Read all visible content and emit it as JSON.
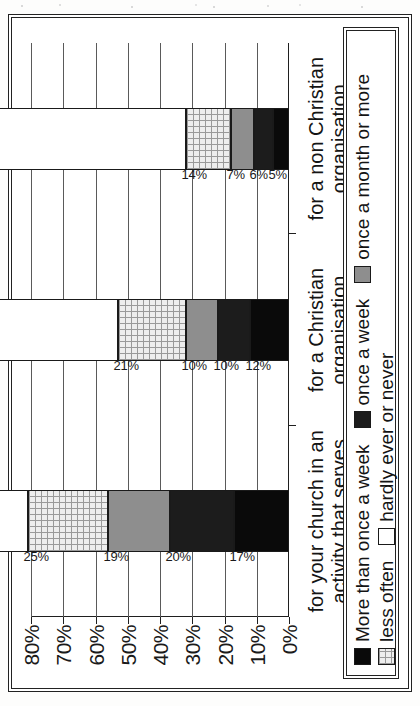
{
  "chart_data": {
    "type": "bar",
    "subtype": "stacked-bar-horizontal-groups",
    "title": "",
    "xlabel": "",
    "ylabel": "",
    "ylim": [
      0,
      80
    ],
    "ytick_labels": [
      "80%",
      "70%",
      "60%",
      "50%",
      "40%",
      "30%",
      "20%",
      "10%",
      "0%"
    ],
    "ytick_values": [
      80,
      70,
      60,
      50,
      40,
      30,
      20,
      10,
      0
    ],
    "grid": true,
    "legend_position": "bottom",
    "orientation_note": "figure printed rotated 90 degrees counter-clockwise on the page",
    "categories": [
      "for your church in an activity that serves the community",
      "for a Christian organisation",
      "for a non Christian organisation"
    ],
    "series": [
      {
        "name": "More than once a week",
        "values": [
          17,
          12,
          5
        ],
        "color": "#0a0a0a",
        "pattern": "solid"
      },
      {
        "name": "once a week",
        "values": [
          20,
          10,
          6
        ],
        "color": "#1c1c1c",
        "pattern": "solid"
      },
      {
        "name": "once a month or more",
        "values": [
          19,
          10,
          7
        ],
        "color": "#8e8e8e",
        "pattern": "solid"
      },
      {
        "name": "less often",
        "values": [
          25,
          21,
          14
        ],
        "color": "#eeeeee",
        "pattern": "grid"
      },
      {
        "name": "hardly ever or never",
        "values": [
          19,
          48,
          68
        ],
        "color": "#ffffff",
        "pattern": "none"
      }
    ],
    "data_labels": [
      [
        "17%",
        "20%",
        "19%",
        "25%",
        "19%"
      ],
      [
        "12%",
        "10%",
        "10%",
        "21%",
        "48%"
      ],
      [
        "5%",
        "6%",
        "7%",
        "14%",
        "68%"
      ]
    ]
  },
  "axis": {
    "ticks": [
      {
        "label": "80%",
        "value": 80
      },
      {
        "label": "70%",
        "value": 70
      },
      {
        "label": "60%",
        "value": 60
      },
      {
        "label": "50%",
        "value": 50
      },
      {
        "label": "40%",
        "value": 40
      },
      {
        "label": "30%",
        "value": 30
      },
      {
        "label": "20%",
        "value": 20
      },
      {
        "label": "10%",
        "value": 10
      },
      {
        "label": "0%",
        "value": 0
      }
    ]
  },
  "categories": [
    {
      "line1": "for your church in an",
      "line2": "activity that serves the",
      "line3": "community"
    },
    {
      "line1": "for a Christian",
      "line2": "organisation",
      "line3": ""
    },
    {
      "line1": "for a non Christian",
      "line2": "organisation",
      "line3": ""
    }
  ],
  "legend": {
    "row1": [
      {
        "label": "More than once a week",
        "swatch": "black-swatch"
      },
      {
        "label": "once a week",
        "swatch": "dark-swatch"
      },
      {
        "label": "once a month or more",
        "swatch": "grey-swatch"
      }
    ],
    "row2": [
      {
        "label": "less often",
        "swatch": "grid-swatch"
      },
      {
        "label": "hardly ever or never",
        "swatch": "white-swatch"
      }
    ]
  },
  "colors": {
    "more_than_once_a_week": "#0a0a0a",
    "once_a_week": "#1c1c1c",
    "once_a_month_or_more": "#8e8e8e",
    "less_often": "#eeeeee",
    "hardly_ever_or_never": "#ffffff",
    "frame": "#222222",
    "gridline": "#5a5a5a"
  }
}
